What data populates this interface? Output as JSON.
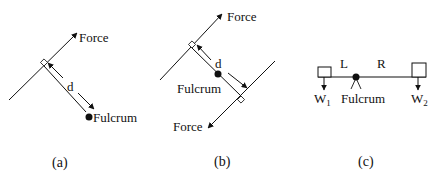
{
  "panels": {
    "a": {
      "caption": "(a)",
      "force_label": "Force",
      "distance_label": "d",
      "fulcrum_label": "Fulcrum"
    },
    "b": {
      "caption": "(b)",
      "force_top_label": "Force",
      "force_bottom_label": "Force",
      "distance_label": "d",
      "fulcrum_label": "Fulcrum"
    },
    "c": {
      "caption": "(c)",
      "left_label": "L",
      "right_label": "R",
      "weight_left": "W",
      "weight_left_sub": "1",
      "weight_right": "W",
      "weight_right_sub": "2",
      "fulcrum_label": "Fulcrum"
    }
  },
  "colors": {
    "ink": "#111111",
    "background": "#ffffff"
  }
}
